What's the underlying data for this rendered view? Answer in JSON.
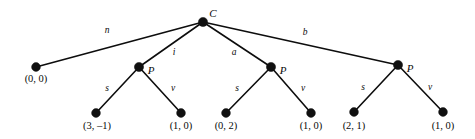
{
  "diagram": {
    "type": "tree",
    "background_color": "#ffffff",
    "line_color": "#0d0d0d",
    "node_color": "#101010",
    "width": 475,
    "height": 139
  },
  "nodes": [
    {
      "id": "root",
      "label": "C",
      "kind": "nonterminal",
      "x": 203,
      "y": 22,
      "r": 4.6,
      "label_x": 213,
      "label_y": 13
    },
    {
      "id": "n1",
      "label": "(0, 0)",
      "kind": "leaf",
      "x": 36,
      "y": 67,
      "r": 4.4,
      "label_x": 36,
      "label_y": 79
    },
    {
      "id": "p1",
      "label": "P",
      "kind": "nonterminal",
      "x": 139,
      "y": 67,
      "r": 4.6,
      "label_x": 151,
      "label_y": 70
    },
    {
      "id": "p2",
      "label": "P",
      "kind": "nonterminal",
      "x": 271,
      "y": 67,
      "r": 4.6,
      "label_x": 283,
      "label_y": 70
    },
    {
      "id": "p3",
      "label": "P",
      "kind": "nonterminal",
      "x": 398,
      "y": 65,
      "r": 4.6,
      "label_x": 410,
      "label_y": 68
    },
    {
      "id": "l1",
      "label": "(3, –1)",
      "kind": "leaf",
      "x": 96,
      "y": 113,
      "r": 4.4,
      "label_x": 97,
      "label_y": 126
    },
    {
      "id": "l2",
      "label": "(1, 0)",
      "kind": "leaf",
      "x": 181,
      "y": 113,
      "r": 4.4,
      "label_x": 181,
      "label_y": 126
    },
    {
      "id": "l3",
      "label": "(0, 2)",
      "kind": "leaf",
      "x": 226,
      "y": 113,
      "r": 4.4,
      "label_x": 226,
      "label_y": 126
    },
    {
      "id": "l4",
      "label": "(1, 0)",
      "kind": "leaf",
      "x": 311,
      "y": 113,
      "r": 4.4,
      "label_x": 311,
      "label_y": 126
    },
    {
      "id": "l5",
      "label": "(2, 1)",
      "kind": "leaf",
      "x": 354,
      "y": 112,
      "r": 4.4,
      "label_x": 354,
      "label_y": 126
    },
    {
      "id": "l6",
      "label": "(1, 0)",
      "kind": "leaf",
      "x": 443,
      "y": 112,
      "r": 4.4,
      "label_x": 443,
      "label_y": 126
    }
  ],
  "edges": [
    {
      "id": "e-root-n1",
      "from": "root",
      "to": "n1",
      "label": "n",
      "x1": 203,
      "y1": 22,
      "x2": 36,
      "y2": 67,
      "label_x": 107,
      "label_y": 31
    },
    {
      "id": "e-root-p1",
      "from": "root",
      "to": "p1",
      "label": "i",
      "x1": 203,
      "y1": 22,
      "x2": 139,
      "y2": 67,
      "label_x": 174,
      "label_y": 53
    },
    {
      "id": "e-root-p2",
      "from": "root",
      "to": "p2",
      "label": "a",
      "x1": 203,
      "y1": 22,
      "x2": 271,
      "y2": 67,
      "label_x": 234,
      "label_y": 53
    },
    {
      "id": "e-root-p3",
      "from": "root",
      "to": "p3",
      "label": "b",
      "x1": 203,
      "y1": 22,
      "x2": 398,
      "y2": 65,
      "label_x": 305,
      "label_y": 33
    },
    {
      "id": "e-p1-l1",
      "from": "p1",
      "to": "l1",
      "label": "s",
      "x1": 139,
      "y1": 67,
      "x2": 96,
      "y2": 113,
      "label_x": 107,
      "label_y": 89
    },
    {
      "id": "e-p1-l2",
      "from": "p1",
      "to": "l2",
      "label": "v",
      "x1": 139,
      "y1": 67,
      "x2": 181,
      "y2": 113,
      "label_x": 173,
      "label_y": 89
    },
    {
      "id": "e-p2-l3",
      "from": "p2",
      "to": "l3",
      "label": "s",
      "x1": 271,
      "y1": 67,
      "x2": 226,
      "y2": 113,
      "label_x": 237,
      "label_y": 89
    },
    {
      "id": "e-p2-l4",
      "from": "p2",
      "to": "l4",
      "label": "v",
      "x1": 271,
      "y1": 67,
      "x2": 311,
      "y2": 113,
      "label_x": 303,
      "label_y": 89
    },
    {
      "id": "e-p3-l5",
      "from": "p3",
      "to": "l5",
      "label": "s",
      "x1": 398,
      "y1": 65,
      "x2": 354,
      "y2": 112,
      "label_x": 363,
      "label_y": 88
    },
    {
      "id": "e-p3-l6",
      "from": "p3",
      "to": "l6",
      "label": "v",
      "x1": 398,
      "y1": 65,
      "x2": 443,
      "y2": 112,
      "label_x": 430,
      "label_y": 88
    }
  ]
}
